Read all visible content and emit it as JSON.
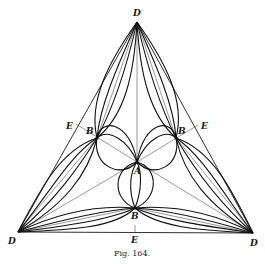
{
  "figure": {
    "caption": "Fig. 164.",
    "labels": {
      "d_top": "D",
      "d_left": "D",
      "d_right": "D",
      "e_left": "E",
      "e_right": "E",
      "e_bottom": "E",
      "b_left": "B",
      "b_right": "B",
      "b_bottom": "B",
      "a_center": "A"
    }
  }
}
